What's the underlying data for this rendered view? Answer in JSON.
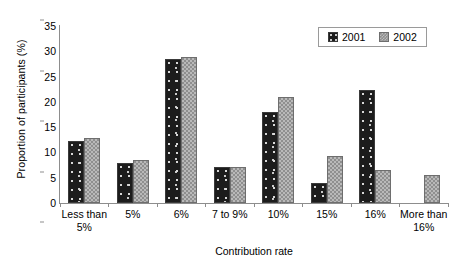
{
  "chart_data": {
    "type": "bar",
    "title": "",
    "xlabel": "Contribution rate",
    "ylabel": "Proportion of participants (%)",
    "ylim": [
      0,
      35
    ],
    "yticks": [
      0,
      5,
      10,
      15,
      20,
      25,
      30,
      35
    ],
    "grid": false,
    "legend_position": "top-right",
    "categories": [
      "Less than 5%",
      "5%",
      "6%",
      "7 to 9%",
      "10%",
      "15%",
      "16%",
      "More than 16%"
    ],
    "series": [
      {
        "name": "2001",
        "color": "#1c1c1c",
        "values": [
          12.3,
          8.0,
          28.4,
          7.1,
          17.9,
          4.0,
          22.4,
          null
        ]
      },
      {
        "name": "2002",
        "color": "#8f8f8f",
        "values": [
          12.9,
          8.5,
          28.9,
          7.1,
          21.0,
          9.3,
          6.6,
          5.6
        ]
      }
    ]
  },
  "legend": {
    "items": [
      {
        "label": "2001",
        "swatch": "series-2001-swatch"
      },
      {
        "label": "2002",
        "swatch": "series-2002-swatch"
      }
    ]
  }
}
